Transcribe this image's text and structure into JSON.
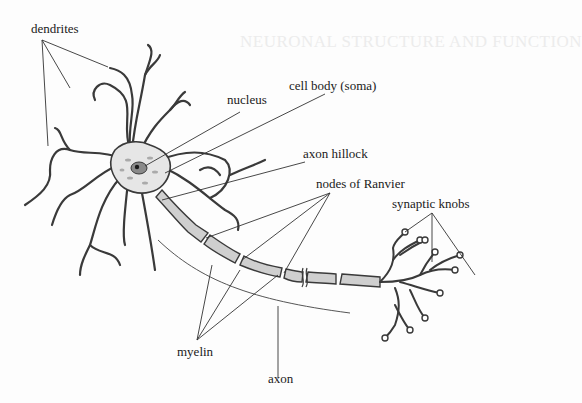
{
  "background_text": {
    "title": "NEURONAL STRUCTURE AND FUNCTION"
  },
  "diagram": {
    "subject": "neuron",
    "labels": {
      "dendrites": "dendrites",
      "nucleus": "nucleus",
      "cell_body": "cell body (soma)",
      "axon_hillock": "axon hillock",
      "nodes_of_ranvier": "nodes of Ranvier",
      "synaptic_knobs": "synaptic knobs",
      "myelin": "myelin",
      "axon": "axon"
    },
    "colors": {
      "outline": "#3a3a3a",
      "soma_fill": "#e6e6e6",
      "nucleus_fill": "#8a8a8a",
      "myelin_fill": "#cfcfcf",
      "leader_line": "#333333"
    }
  }
}
